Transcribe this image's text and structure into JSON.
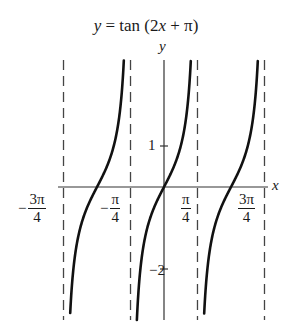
{
  "chart_data": {
    "type": "line",
    "title": "y = tan (2x + π)",
    "function": "tan(2x + π)",
    "xlabel": "x",
    "ylabel": "y",
    "x_ticks": [
      {
        "value": -2.356,
        "label": "−3π/4",
        "sign": "−",
        "num": "3π",
        "den": "4"
      },
      {
        "value": -0.785,
        "label": "−π/4",
        "sign": "−",
        "num": "π",
        "den": "4"
      },
      {
        "value": 0.785,
        "label": "π/4",
        "sign": "",
        "num": "π",
        "den": "4"
      },
      {
        "value": 2.356,
        "label": "3π/4",
        "sign": "",
        "num": "3π",
        "den": "4"
      }
    ],
    "y_ticks": [
      {
        "value": 1,
        "label": "1"
      },
      {
        "value": -2,
        "label": "-2"
      }
    ],
    "asymptotes_x": [
      -2.356,
      -0.785,
      0.785,
      2.356
    ],
    "branches": [
      {
        "center_x": -1.571,
        "x_range": [
          -2.356,
          -0.785
        ]
      },
      {
        "center_x": 0,
        "x_range": [
          -0.785,
          0.785
        ]
      },
      {
        "center_x": 1.571,
        "x_range": [
          0.785,
          2.356
        ]
      }
    ],
    "xlim": [
      -2.5,
      2.45
    ],
    "ylim": [
      -3.2,
      3.1
    ],
    "grid": false,
    "legend": null
  },
  "labels": {
    "title_y": "y",
    "title_eq": " = tan (2",
    "title_x": "x",
    "title_rest": " + π)",
    "y_axis": "y",
    "x_axis": "x",
    "tick_1": "1",
    "tick_neg2": "2",
    "tick_neg2_sign": "−"
  },
  "colors": {
    "curve": "#111111",
    "axis": "#333333",
    "asymptote": "#444444"
  }
}
